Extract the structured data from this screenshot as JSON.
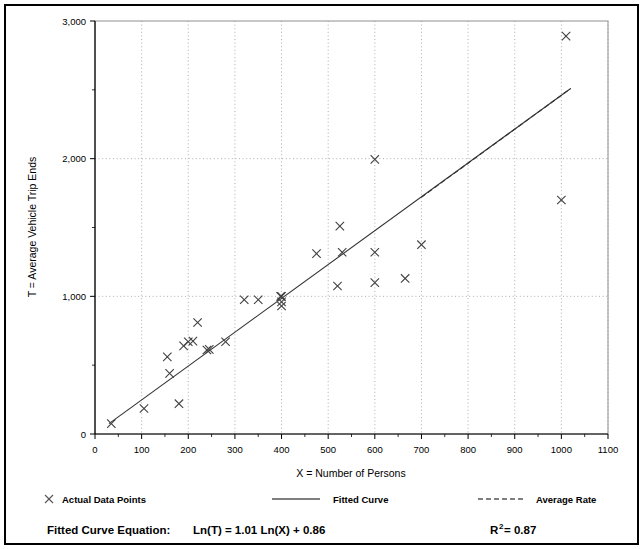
{
  "figure": {
    "background": "#ffffff",
    "frame_color": "#000000",
    "plot_border_color": "#808080",
    "gridline_color": "#999999",
    "marker_color": "#404040",
    "line_color": "#333333"
  },
  "legend": {
    "items": [
      {
        "marker": "x-marker-icon",
        "label": "Actual Data Points"
      },
      {
        "marker": "solid-line-icon",
        "label": "Fitted Curve"
      },
      {
        "marker": "dashed-line-icon",
        "label": "Average Rate"
      }
    ]
  },
  "equation": {
    "prefix": "Fitted Curve Equation:",
    "formula": "Ln(T) = 1.01 Ln(X) + 0.86",
    "r2_base": "R",
    "r2_sup": "2",
    "r2_value": " = 0.87"
  },
  "chart_data": {
    "type": "scatter",
    "title": "",
    "xlabel": "X = Number of Persons",
    "ylabel": "T = Average Vehicle Trip Ends",
    "xlim": [
      0,
      1100
    ],
    "ylim": [
      0,
      3000
    ],
    "xticks": [
      0,
      100,
      200,
      300,
      400,
      500,
      600,
      700,
      800,
      900,
      1000,
      1100
    ],
    "xtick_labels": [
      "0",
      "100",
      "200",
      "300",
      "400",
      "500",
      "600",
      "700",
      "800",
      "900",
      "1000",
      "1100"
    ],
    "yticks": [
      0,
      1000,
      2000,
      3000
    ],
    "ytick_labels": [
      "0",
      "1,000",
      "2,000",
      "3,000"
    ],
    "yminor_ticks": [
      500,
      1500,
      2500
    ],
    "grid": {
      "x": "dotted-vertical-every-100",
      "y": "dotted-horizontal-every-1000"
    },
    "legend_position": "below-axes",
    "series": [
      {
        "name": "Actual Data Points",
        "type": "scatter",
        "marker": "x",
        "points": [
          [
            35,
            75
          ],
          [
            105,
            185
          ],
          [
            155,
            560
          ],
          [
            160,
            440
          ],
          [
            180,
            220
          ],
          [
            190,
            640
          ],
          [
            200,
            670
          ],
          [
            210,
            675
          ],
          [
            220,
            810
          ],
          [
            240,
            610
          ],
          [
            245,
            615
          ],
          [
            280,
            670
          ],
          [
            320,
            975
          ],
          [
            350,
            975
          ],
          [
            398,
            1000
          ],
          [
            400,
            1000
          ],
          [
            400,
            960
          ],
          [
            400,
            930
          ],
          [
            475,
            1310
          ],
          [
            520,
            1075
          ],
          [
            525,
            1510
          ],
          [
            530,
            1320
          ],
          [
            600,
            1995
          ],
          [
            600,
            1320
          ],
          [
            600,
            1100
          ],
          [
            665,
            1130
          ],
          [
            700,
            1375
          ],
          [
            1000,
            1700
          ],
          [
            1010,
            2890
          ]
        ]
      },
      {
        "name": "Fitted Curve",
        "type": "line",
        "style": "solid",
        "equation": "Ln(T) = 1.01 Ln(X) + 0.86",
        "endpoints": [
          [
            30,
            75
          ],
          [
            1020,
            2510
          ]
        ]
      },
      {
        "name": "Average Rate",
        "type": "line",
        "style": "dashed",
        "endpoints": [
          [
            700,
            1720
          ],
          [
            1020,
            2510
          ]
        ]
      }
    ]
  }
}
